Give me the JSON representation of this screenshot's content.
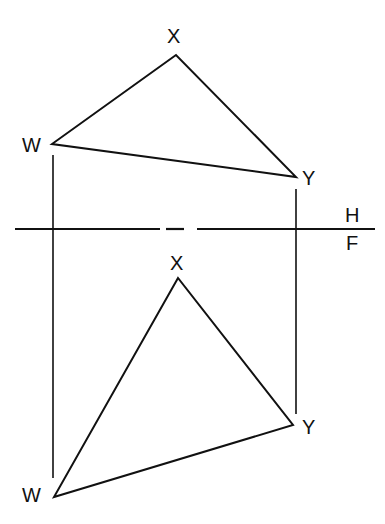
{
  "diagram": {
    "type": "orthographic-projection",
    "line_color": "#111111",
    "background": "#ffffff",
    "folding_line": {
      "label_above": "H",
      "label_below": "F",
      "y": 229,
      "x_start": 15,
      "x_end": 375
    },
    "top_view": {
      "vertices": {
        "X": {
          "label": "X",
          "x": 176,
          "y": 55
        },
        "W": {
          "label": "W",
          "x": 52,
          "y": 144
        },
        "Y": {
          "label": "Y",
          "x": 296,
          "y": 177
        }
      }
    },
    "front_view": {
      "vertices": {
        "X": {
          "label": "X",
          "x": 178,
          "y": 278
        },
        "W": {
          "label": "W",
          "x": 54,
          "y": 497
        },
        "Y": {
          "label": "Y",
          "x": 293,
          "y": 425
        }
      }
    },
    "projectors": [
      {
        "name": "W-projector",
        "x": 53,
        "y1": 155,
        "y2": 478
      },
      {
        "name": "Y-projector",
        "x": 296,
        "y1": 189,
        "y2": 414
      }
    ]
  }
}
